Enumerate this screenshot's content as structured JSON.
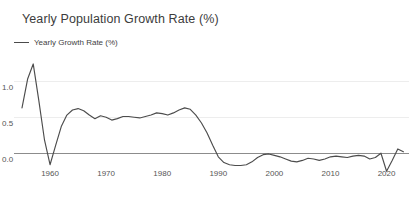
{
  "header": {
    "title": "Yearly Population Growth Rate (%)"
  },
  "legend": {
    "entries": [
      {
        "label": "Yearly Growth Rate (%)",
        "color": "#4a4a4a",
        "marker": "line-swatch"
      }
    ]
  },
  "chart_data": {
    "type": "line",
    "title": "Yearly Population Growth Rate (%)",
    "xlabel": "",
    "ylabel": "",
    "legend": [
      "Yearly Growth Rate (%)"
    ],
    "legend_position": "top-left",
    "grid": true,
    "xlim": [
      1955,
      2024
    ],
    "ylim": [
      -0.32,
      1.32
    ],
    "xticks": [
      1960,
      1970,
      1980,
      1990,
      2000,
      2010,
      2020
    ],
    "xticklabels": [
      "1960",
      "1970",
      "1980",
      "1990",
      "2000",
      "2010",
      "2020"
    ],
    "yticks": [
      0.0,
      0.5,
      1.0
    ],
    "yticklabels": [
      "0.0",
      "0.5",
      "1.0"
    ],
    "line_color": "#4c4c4c",
    "series": [
      {
        "name": "Yearly Growth Rate (%)",
        "x": [
          1955,
          1956,
          1957,
          1958,
          1959,
          1960,
          1961,
          1962,
          1963,
          1964,
          1965,
          1966,
          1967,
          1968,
          1969,
          1970,
          1971,
          1972,
          1973,
          1974,
          1975,
          1976,
          1977,
          1978,
          1979,
          1980,
          1981,
          1982,
          1983,
          1984,
          1985,
          1986,
          1987,
          1988,
          1989,
          1990,
          1991,
          1992,
          1993,
          1994,
          1995,
          1996,
          1997,
          1998,
          1999,
          2000,
          2001,
          2002,
          2003,
          2004,
          2005,
          2006,
          2007,
          2008,
          2009,
          2010,
          2011,
          2012,
          2013,
          2014,
          2015,
          2016,
          2017,
          2018,
          2019,
          2020,
          2021,
          2022,
          2023
        ],
        "values": [
          0.62,
          1.02,
          1.23,
          0.72,
          0.18,
          -0.17,
          0.1,
          0.36,
          0.52,
          0.59,
          0.61,
          0.58,
          0.52,
          0.47,
          0.51,
          0.49,
          0.45,
          0.47,
          0.5,
          0.5,
          0.49,
          0.48,
          0.5,
          0.52,
          0.55,
          0.54,
          0.52,
          0.55,
          0.59,
          0.62,
          0.6,
          0.52,
          0.41,
          0.27,
          0.1,
          -0.06,
          -0.14,
          -0.17,
          -0.18,
          -0.18,
          -0.17,
          -0.13,
          -0.07,
          -0.03,
          -0.02,
          -0.04,
          -0.06,
          -0.09,
          -0.12,
          -0.13,
          -0.11,
          -0.08,
          -0.09,
          -0.11,
          -0.09,
          -0.06,
          -0.05,
          -0.06,
          -0.07,
          -0.05,
          -0.04,
          -0.05,
          -0.09,
          -0.07,
          -0.01,
          -0.26,
          -0.11,
          0.05,
          0.01
        ]
      }
    ]
  }
}
